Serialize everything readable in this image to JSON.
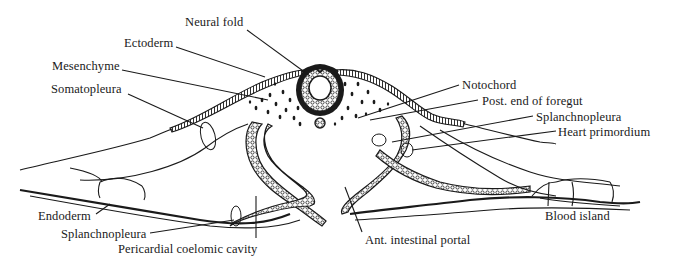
{
  "figure": {
    "type": "embryology cross-section drawing",
    "colors": {
      "ink": "#1a1a1a",
      "background": "#ffffff"
    }
  },
  "labels": {
    "neural_fold": "Neural fold",
    "ectoderm": "Ectoderm",
    "mesenchyme": "Mesenchyme",
    "somatopleura": "Somatopleura",
    "notochord": "Notochord",
    "post_end_foregut": "Post. end of foregut",
    "splanchnopleura_right": "Splanchnopleura",
    "heart_primordium": "Heart primordium",
    "endoderm": "Endoderm",
    "splanchnopleura_left": "Splanchnopleura",
    "pericardial_coelomic_cavity": "Pericardial coelomic cavity",
    "ant_intestinal_portal": "Ant. intestinal portal",
    "blood_island": "Blood island"
  }
}
